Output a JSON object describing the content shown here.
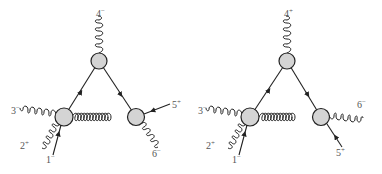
{
  "diagrams": [
    {
      "name": "left",
      "vertices": {
        "top": {
          "x": 99,
          "y": 61,
          "r": 8
        },
        "bl": {
          "x": 64,
          "y": 117,
          "r": 9
        },
        "br": {
          "x": 136,
          "y": 117,
          "r": 8.5
        }
      },
      "labels": [
        {
          "id": "p4",
          "num": "4",
          "hel": "−",
          "x": 96,
          "y": 17
        },
        {
          "id": "p3",
          "num": "3",
          "hel": "−",
          "x": 11,
          "y": 114
        },
        {
          "id": "p2",
          "num": "2",
          "hel": "+",
          "x": 20,
          "y": 149
        },
        {
          "id": "p1",
          "num": "1",
          "hel": "−",
          "x": 46,
          "y": 163
        },
        {
          "id": "p5",
          "num": "5",
          "hel": "+",
          "x": 172,
          "y": 108
        },
        {
          "id": "p6",
          "num": "6",
          "hel": "−",
          "x": 152,
          "y": 157
        }
      ]
    },
    {
      "name": "right",
      "vertices": {
        "top": {
          "x": 287,
          "y": 61,
          "r": 8
        },
        "bl": {
          "x": 250,
          "y": 117,
          "r": 9
        },
        "br": {
          "x": 321,
          "y": 117,
          "r": 8.5
        }
      },
      "labels": [
        {
          "id": "p4",
          "num": "4",
          "hel": "+",
          "x": 284,
          "y": 17
        },
        {
          "id": "p3",
          "num": "3",
          "hel": "−",
          "x": 198,
          "y": 114
        },
        {
          "id": "p2",
          "num": "2",
          "hel": "+",
          "x": 206,
          "y": 149
        },
        {
          "id": "p1",
          "num": "1",
          "hel": "−",
          "x": 232,
          "y": 163
        },
        {
          "id": "p6",
          "num": "6",
          "hel": "−",
          "x": 357,
          "y": 108
        },
        {
          "id": "p5",
          "num": "5",
          "hel": "+",
          "x": 336,
          "y": 156
        }
      ]
    }
  ],
  "colors": {
    "blob_fill": "#d4d4d4",
    "stroke": "#222222",
    "label": "#555555"
  }
}
